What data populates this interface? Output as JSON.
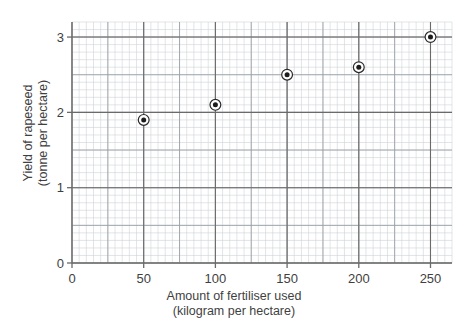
{
  "chart_data": {
    "type": "scatter",
    "title": "",
    "xlabel": "Amount of fertiliser used",
    "xlabel_units": "(kilogram per hectare)",
    "ylabel": "Yield of rapeseed",
    "ylabel_units": "(tonne per hectare)",
    "x": [
      50,
      100,
      150,
      200,
      250
    ],
    "values": [
      1.9,
      2.1,
      2.5,
      2.6,
      3.0
    ],
    "points": [
      {
        "x": 50,
        "y": 1.9
      },
      {
        "x": 100,
        "y": 2.1
      },
      {
        "x": 150,
        "y": 2.5
      },
      {
        "x": 200,
        "y": 2.6
      },
      {
        "x": 250,
        "y": 3.0
      }
    ],
    "xlim": [
      0,
      265
    ],
    "ylim": [
      0,
      3.2
    ],
    "xticks": [
      0,
      50,
      100,
      150,
      200,
      250
    ],
    "xtick_labels": [
      "0",
      "50",
      "100",
      "150",
      "200",
      "250"
    ],
    "yticks": [
      0,
      1,
      2,
      3
    ],
    "ytick_labels": [
      "0",
      "1",
      "2",
      "3"
    ],
    "grid": true,
    "grid_minor_step_x": 5,
    "grid_minor_step_y": 0.1,
    "grid_major_step_x": 25,
    "grid_major_step_y": 0.5,
    "legend": null,
    "marker": "bullseye-dot",
    "colors": {
      "axis": "#6a6a6a",
      "grid_major": "#9aa0a6",
      "grid_minor": "#cfd3d6",
      "marker_fill": "#1c1c1c",
      "marker_ring": "#2b2b2b",
      "text": "#3f3f3f",
      "background": "#ffffff"
    }
  }
}
